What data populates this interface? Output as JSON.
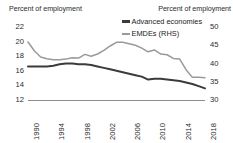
{
  "chart_data": {
    "type": "line",
    "title": "",
    "ylabel": "Percent of employment",
    "ylabel_right": "Percent of employment",
    "xlabel": "",
    "ylim": [
      12,
      22
    ],
    "ylim_right": [
      30,
      50
    ],
    "yticks": [
      "22",
      "20",
      "18",
      "16",
      "14",
      "12"
    ],
    "yticks_right": [
      "50",
      "45",
      "40",
      "35",
      "30"
    ],
    "xticks": [
      "1990",
      "1994",
      "1998",
      "2002",
      "2006",
      "2010",
      "2014",
      "2018"
    ],
    "x": [
      1990,
      1991,
      1992,
      1993,
      1994,
      1995,
      1996,
      1997,
      1998,
      1999,
      2000,
      2001,
      2002,
      2003,
      2004,
      2005,
      2006,
      2007,
      2008,
      2009,
      2010,
      2011,
      2012,
      2013,
      2014,
      2015,
      2016,
      2017,
      2018
    ],
    "grid": false,
    "legend_position": "top-right",
    "series": [
      {
        "name": "Advanced economies",
        "axis": "left",
        "color": "#3b3b3b",
        "values": [
          16.6,
          16.6,
          16.6,
          16.6,
          16.7,
          16.9,
          17.0,
          17.0,
          16.9,
          16.9,
          16.8,
          16.6,
          16.4,
          16.2,
          16.0,
          15.8,
          15.6,
          15.4,
          15.2,
          14.8,
          14.9,
          14.9,
          14.8,
          14.7,
          14.6,
          14.4,
          14.2,
          13.9,
          13.6
        ]
      },
      {
        "name": "EMDEs (RHS)",
        "axis": "right",
        "color": "#9a9a9a",
        "values": [
          45.9,
          43.5,
          41.8,
          41.3,
          41.0,
          41.0,
          41.2,
          41.6,
          41.5,
          42.5,
          42.0,
          42.6,
          43.6,
          44.8,
          45.8,
          45.8,
          45.4,
          45.0,
          44.2,
          43.2,
          43.7,
          42.6,
          42.4,
          41.4,
          41.2,
          38.3,
          36.2,
          36.2,
          36.1
        ]
      }
    ]
  },
  "legend": {
    "items": [
      {
        "label": "Advanced economies",
        "icon": "line-swatch-dark"
      },
      {
        "label": "EMDEs (RHS)",
        "icon": "line-swatch-gray"
      }
    ]
  }
}
